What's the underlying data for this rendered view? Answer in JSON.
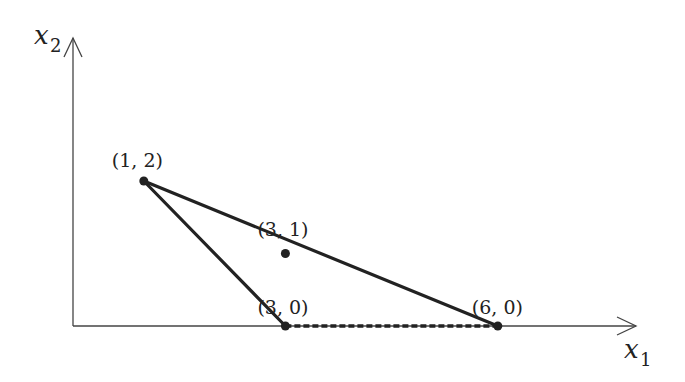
{
  "diagram": {
    "axes": {
      "x_label": "x",
      "x_sub": "1",
      "y_label": "x",
      "y_sub": "2"
    },
    "points": [
      {
        "id": "p12",
        "label": "(1, 2)",
        "x": 1,
        "y": 2
      },
      {
        "id": "p31",
        "label": "(3, 1)",
        "x": 3,
        "y": 1
      },
      {
        "id": "p30",
        "label": "(3, 0)",
        "x": 3,
        "y": 0
      },
      {
        "id": "p60",
        "label": "(6, 0)",
        "x": 6,
        "y": 0
      }
    ],
    "solid_edges": [
      [
        "p12",
        "p60"
      ],
      [
        "p12",
        "p30"
      ]
    ],
    "dashed_edges": [
      [
        "p30",
        "p60"
      ]
    ],
    "colors": {
      "line": "#222222",
      "axis": "#555555"
    }
  }
}
